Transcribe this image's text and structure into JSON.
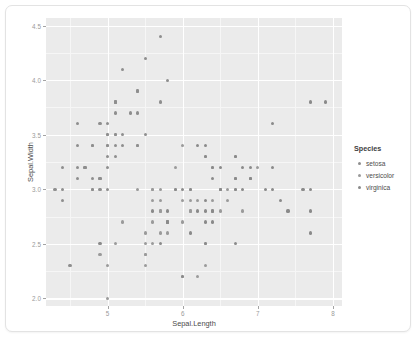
{
  "chart_data": {
    "type": "scatter",
    "title": "",
    "xlabel": "Sepal.Length",
    "ylabel": "Sepal.Width",
    "xlim": [
      4.18,
      8.12
    ],
    "ylim": [
      1.93,
      4.57
    ],
    "xticks": [
      5,
      6,
      7,
      8
    ],
    "xticklabels": [
      "5",
      "6",
      "7",
      "8"
    ],
    "yticks": [
      2.0,
      2.5,
      3.0,
      3.5,
      4.0,
      4.5
    ],
    "yticklabels": [
      "2.0",
      "2.5",
      "3.0",
      "3.5",
      "4.0",
      "4.5"
    ],
    "x_minor_ticks": [
      4.5,
      5.5,
      6.5,
      7.5
    ],
    "y_minor_ticks": [
      2.25,
      2.75,
      3.25,
      3.75,
      4.25
    ],
    "grid": true,
    "legend": {
      "title": "Species",
      "position": "right",
      "entries": [
        {
          "name": "setosa",
          "color": "#8e8e8e"
        },
        {
          "name": "versicolor",
          "color": "#9a9a9a"
        },
        {
          "name": "virginica",
          "color": "#8a8a8a"
        }
      ]
    },
    "point_color": "#8c8c8c",
    "panel_background": "#ebebeb",
    "gridline_color": "#ffffff",
    "series": [
      {
        "name": "setosa",
        "color": "#8e8e8e",
        "points": [
          [
            5.1,
            3.5
          ],
          [
            4.9,
            3.0
          ],
          [
            4.7,
            3.2
          ],
          [
            4.6,
            3.1
          ],
          [
            5.0,
            3.6
          ],
          [
            5.4,
            3.9
          ],
          [
            4.6,
            3.4
          ],
          [
            5.0,
            3.4
          ],
          [
            4.4,
            2.9
          ],
          [
            4.9,
            3.1
          ],
          [
            5.4,
            3.7
          ],
          [
            4.8,
            3.4
          ],
          [
            4.8,
            3.0
          ],
          [
            4.3,
            3.0
          ],
          [
            5.8,
            4.0
          ],
          [
            5.7,
            4.4
          ],
          [
            5.4,
            3.9
          ],
          [
            5.1,
            3.5
          ],
          [
            5.7,
            3.8
          ],
          [
            5.1,
            3.8
          ],
          [
            5.4,
            3.4
          ],
          [
            5.1,
            3.7
          ],
          [
            4.6,
            3.6
          ],
          [
            5.1,
            3.3
          ],
          [
            4.8,
            3.4
          ],
          [
            5.0,
            3.0
          ],
          [
            5.0,
            3.4
          ],
          [
            5.2,
            3.5
          ],
          [
            5.2,
            3.4
          ],
          [
            4.7,
            3.2
          ],
          [
            4.8,
            3.1
          ],
          [
            5.4,
            3.4
          ],
          [
            5.2,
            4.1
          ],
          [
            5.5,
            4.2
          ],
          [
            4.9,
            3.1
          ],
          [
            5.0,
            3.2
          ],
          [
            5.5,
            3.5
          ],
          [
            4.9,
            3.6
          ],
          [
            4.4,
            3.0
          ],
          [
            5.1,
            3.4
          ],
          [
            5.0,
            3.5
          ],
          [
            4.5,
            2.3
          ],
          [
            4.4,
            3.2
          ],
          [
            5.0,
            3.5
          ],
          [
            5.1,
            3.8
          ],
          [
            4.8,
            3.0
          ],
          [
            5.1,
            3.8
          ],
          [
            4.6,
            3.2
          ],
          [
            5.3,
            3.7
          ],
          [
            5.0,
            3.3
          ]
        ]
      },
      {
        "name": "versicolor",
        "color": "#9a9a9a",
        "points": [
          [
            7.0,
            3.2
          ],
          [
            6.4,
            3.2
          ],
          [
            6.9,
            3.1
          ],
          [
            5.5,
            2.3
          ],
          [
            6.5,
            2.8
          ],
          [
            5.7,
            2.8
          ],
          [
            6.3,
            3.3
          ],
          [
            4.9,
            2.4
          ],
          [
            6.6,
            2.9
          ],
          [
            5.2,
            2.7
          ],
          [
            5.0,
            2.0
          ],
          [
            5.9,
            3.0
          ],
          [
            6.0,
            2.2
          ],
          [
            6.1,
            2.9
          ],
          [
            5.6,
            2.9
          ],
          [
            6.7,
            3.1
          ],
          [
            5.6,
            3.0
          ],
          [
            5.8,
            2.7
          ],
          [
            6.2,
            2.2
          ],
          [
            5.6,
            2.5
          ],
          [
            5.9,
            3.2
          ],
          [
            6.1,
            2.8
          ],
          [
            6.3,
            2.5
          ],
          [
            6.1,
            2.8
          ],
          [
            6.4,
            2.9
          ],
          [
            6.6,
            3.0
          ],
          [
            6.8,
            2.8
          ],
          [
            6.7,
            3.0
          ],
          [
            6.0,
            2.9
          ],
          [
            5.7,
            2.6
          ],
          [
            5.5,
            2.4
          ],
          [
            5.5,
            2.4
          ],
          [
            5.8,
            2.7
          ],
          [
            6.0,
            2.7
          ],
          [
            5.4,
            3.0
          ],
          [
            6.0,
            3.4
          ],
          [
            6.7,
            3.1
          ],
          [
            6.3,
            2.3
          ],
          [
            5.6,
            3.0
          ],
          [
            5.5,
            2.5
          ],
          [
            5.5,
            2.6
          ],
          [
            6.1,
            3.0
          ],
          [
            5.8,
            2.6
          ],
          [
            5.0,
            2.3
          ],
          [
            5.6,
            2.7
          ],
          [
            5.7,
            3.0
          ],
          [
            5.7,
            2.9
          ],
          [
            6.2,
            2.9
          ],
          [
            5.1,
            2.5
          ],
          [
            5.7,
            2.8
          ]
        ]
      },
      {
        "name": "virginica",
        "color": "#8a8a8a",
        "points": [
          [
            6.3,
            3.3
          ],
          [
            5.8,
            2.7
          ],
          [
            7.1,
            3.0
          ],
          [
            6.3,
            2.9
          ],
          [
            6.5,
            3.0
          ],
          [
            7.6,
            3.0
          ],
          [
            4.9,
            2.5
          ],
          [
            7.3,
            2.9
          ],
          [
            6.7,
            2.5
          ],
          [
            7.2,
            3.6
          ],
          [
            6.5,
            3.2
          ],
          [
            6.4,
            2.7
          ],
          [
            6.8,
            3.0
          ],
          [
            5.7,
            2.5
          ],
          [
            5.8,
            2.8
          ],
          [
            6.4,
            3.2
          ],
          [
            6.5,
            3.0
          ],
          [
            7.7,
            3.8
          ],
          [
            7.7,
            2.6
          ],
          [
            6.0,
            2.2
          ],
          [
            6.9,
            3.2
          ],
          [
            5.6,
            2.8
          ],
          [
            7.7,
            2.8
          ],
          [
            6.3,
            2.7
          ],
          [
            6.7,
            3.3
          ],
          [
            7.2,
            3.2
          ],
          [
            6.2,
            2.8
          ],
          [
            6.1,
            3.0
          ],
          [
            6.4,
            2.8
          ],
          [
            7.2,
            3.0
          ],
          [
            7.4,
            2.8
          ],
          [
            7.9,
            3.8
          ],
          [
            6.4,
            2.8
          ],
          [
            6.3,
            2.8
          ],
          [
            6.1,
            2.6
          ],
          [
            7.7,
            3.0
          ],
          [
            6.3,
            3.4
          ],
          [
            6.4,
            3.1
          ],
          [
            6.0,
            3.0
          ],
          [
            6.9,
            3.1
          ],
          [
            6.7,
            3.1
          ],
          [
            6.9,
            3.1
          ],
          [
            5.8,
            2.7
          ],
          [
            6.8,
            3.2
          ],
          [
            6.7,
            3.3
          ],
          [
            6.7,
            3.0
          ],
          [
            6.3,
            2.5
          ],
          [
            6.5,
            3.0
          ],
          [
            6.2,
            3.4
          ],
          [
            5.9,
            3.0
          ]
        ]
      }
    ]
  }
}
